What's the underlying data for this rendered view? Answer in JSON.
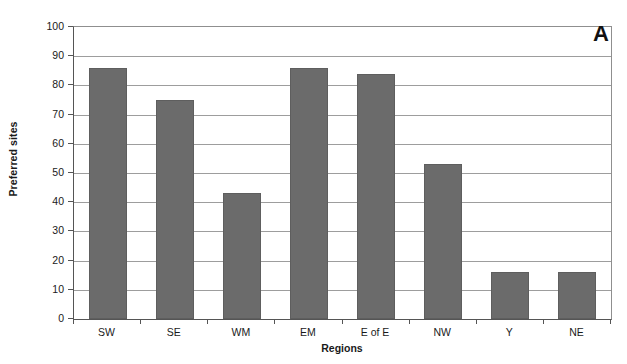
{
  "chart_data": {
    "type": "bar",
    "title": "",
    "panel_label": "A",
    "categories": [
      "SW",
      "SE",
      "WM",
      "EM",
      "E of E",
      "NW",
      "Y",
      "NE"
    ],
    "values": [
      86,
      75,
      43,
      86,
      84,
      53,
      16,
      16
    ],
    "series": [
      {
        "name": "Preferred sites",
        "values": [
          86,
          75,
          43,
          86,
          84,
          53,
          16,
          16
        ]
      }
    ],
    "xlabel": "Regions",
    "ylabel": "Preferred sites",
    "ylim": [
      0,
      100
    ],
    "yticks": [
      0,
      10,
      20,
      30,
      40,
      50,
      60,
      70,
      80,
      90,
      100
    ],
    "ytick_labels": [
      "0",
      "10",
      "20",
      "30",
      "40",
      "50",
      "60",
      "70",
      "80",
      "90",
      "100"
    ],
    "grid": "horizontal",
    "legend": "none",
    "bar_color": "#6b6b6b",
    "bar_edge_color": "#5e5e5e",
    "grid_color": "#9d9d9d",
    "axis_color": "#555555",
    "background_color": "#ffffff"
  }
}
